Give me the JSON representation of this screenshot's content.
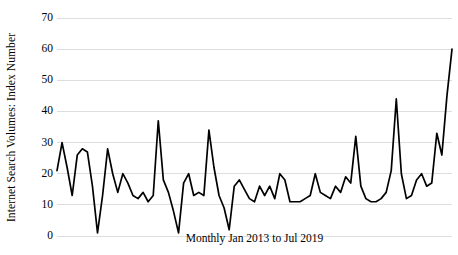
{
  "chart_data": {
    "type": "line",
    "title": "",
    "xlabel": "Monthly Jan 2013 to Jul 2019",
    "ylabel": "Internet Search Volumes: Index Number",
    "ylim": [
      0,
      70
    ],
    "y_ticks": [
      0,
      10,
      20,
      30,
      40,
      50,
      60,
      70
    ],
    "grid": "horizontal",
    "legend": "none",
    "line_color": "#000000",
    "gridline_color": "#d9d9d9",
    "x_start": "Jan 2013",
    "x_end": "Jul 2019",
    "n_points": 79,
    "categories": [
      "Jan 2013",
      "Feb 2013",
      "Mar 2013",
      "Apr 2013",
      "May 2013",
      "Jun 2013",
      "Jul 2013",
      "Aug 2013",
      "Sep 2013",
      "Oct 2013",
      "Nov 2013",
      "Dec 2013",
      "Jan 2014",
      "Feb 2014",
      "Mar 2014",
      "Apr 2014",
      "May 2014",
      "Jun 2014",
      "Jul 2014",
      "Aug 2014",
      "Sep 2014",
      "Oct 2014",
      "Nov 2014",
      "Dec 2014",
      "Jan 2015",
      "Feb 2015",
      "Mar 2015",
      "Apr 2015",
      "May 2015",
      "Jun 2015",
      "Jul 2015",
      "Aug 2015",
      "Sep 2015",
      "Oct 2015",
      "Nov 2015",
      "Dec 2015",
      "Jan 2016",
      "Feb 2016",
      "Mar 2016",
      "Apr 2016",
      "May 2016",
      "Jun 2016",
      "Jul 2016",
      "Aug 2016",
      "Sep 2016",
      "Oct 2016",
      "Nov 2016",
      "Dec 2016",
      "Jan 2017",
      "Feb 2017",
      "Mar 2017",
      "Apr 2017",
      "May 2017",
      "Jun 2017",
      "Jul 2017",
      "Aug 2017",
      "Sep 2017",
      "Oct 2017",
      "Nov 2017",
      "Dec 2017",
      "Jan 2018",
      "Feb 2018",
      "Mar 2018",
      "Apr 2018",
      "May 2018",
      "Jun 2018",
      "Jul 2018",
      "Aug 2018",
      "Sep 2018",
      "Oct 2018",
      "Nov 2018",
      "Dec 2018",
      "Jan 2019",
      "Feb 2019",
      "Mar 2019",
      "Apr 2019",
      "May 2019",
      "Jun 2019",
      "Jul 2019"
    ],
    "values": [
      21,
      30,
      22,
      13,
      26,
      28,
      27,
      16,
      1,
      13,
      28,
      20,
      14,
      20,
      17,
      13,
      12,
      14,
      11,
      13,
      37,
      18,
      14,
      8,
      1,
      17,
      20,
      13,
      14,
      13,
      34,
      22,
      13,
      9,
      2,
      16,
      18,
      15,
      12,
      11,
      16,
      13,
      16,
      12,
      20,
      18,
      11,
      11,
      11,
      12,
      13,
      20,
      14,
      13,
      12,
      16,
      14,
      19,
      17,
      32,
      16,
      12,
      11,
      11,
      12,
      14,
      21,
      44,
      20,
      12,
      13,
      18,
      20,
      16,
      17,
      33,
      26,
      45,
      60
    ]
  },
  "axis": {
    "y_tick_labels": [
      "70",
      "60",
      "50",
      "40",
      "30",
      "20",
      "10",
      "0"
    ]
  }
}
